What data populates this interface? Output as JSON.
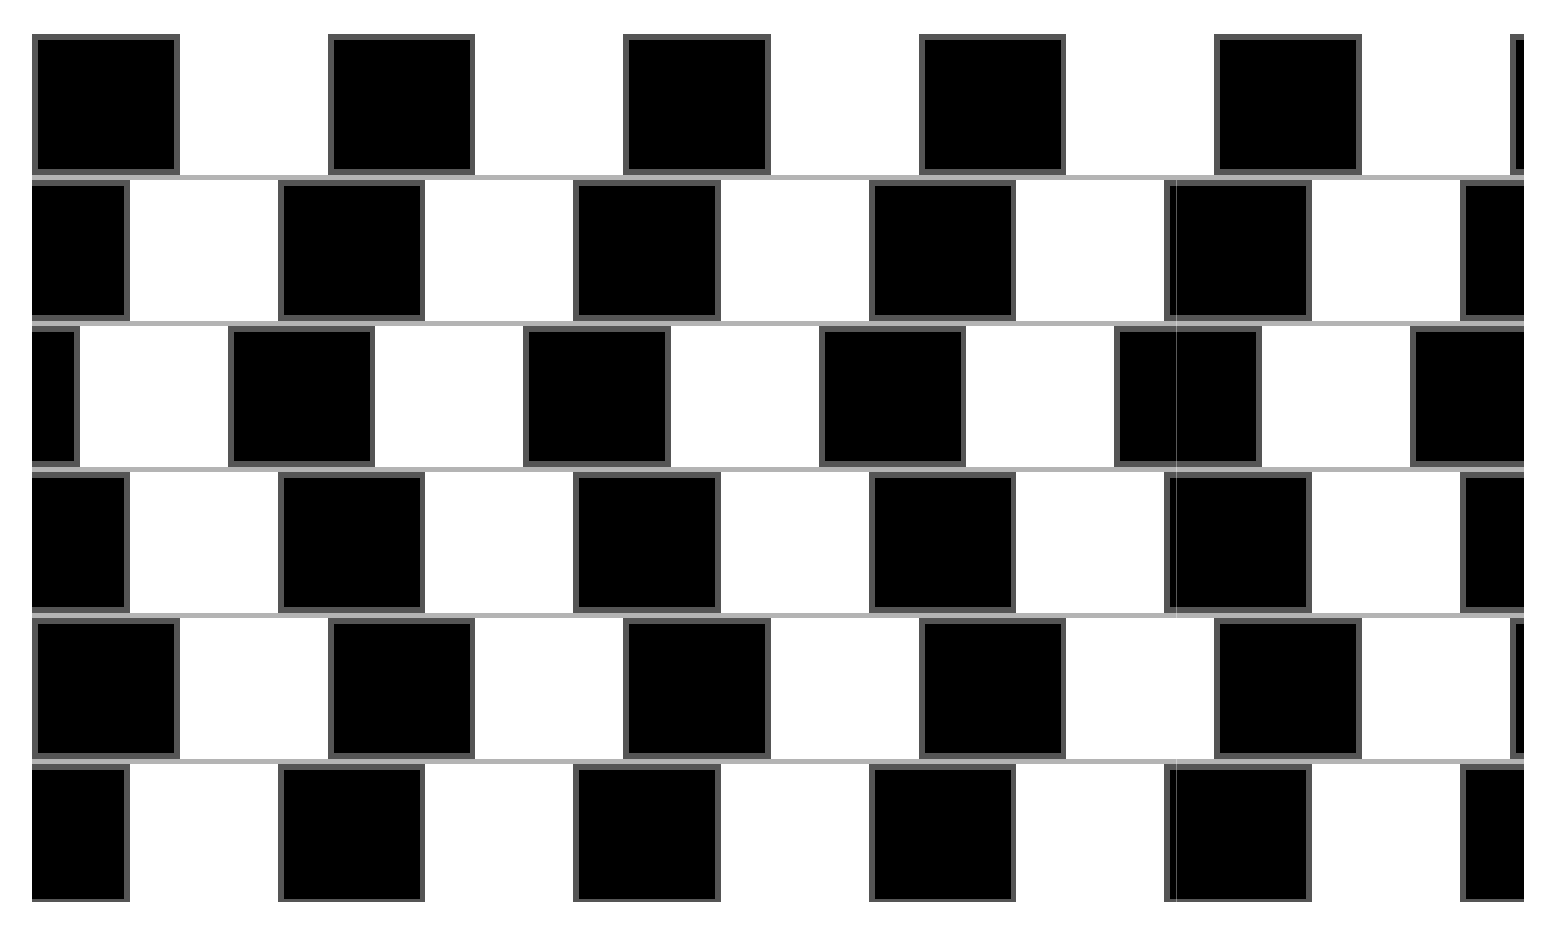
{
  "figure": {
    "colors": {
      "black_tile": "#000000",
      "white_tile": "#ffffff",
      "tile_border": "#555555",
      "mortar": "#b4b4b4",
      "background": "#ffffff"
    },
    "tile_width": 147.75,
    "row_height": 141,
    "mortar_height": 5,
    "rows": [
      {
        "index": 1,
        "top": 0,
        "offset": 0
      },
      {
        "index": 2,
        "top": 146,
        "offset": -50
      },
      {
        "index": 3,
        "top": 292,
        "offset": -100
      },
      {
        "index": 4,
        "top": 438,
        "offset": -50
      },
      {
        "index": 5,
        "top": 584,
        "offset": 0
      },
      {
        "index": 6,
        "top": 730,
        "offset": -50
      }
    ]
  }
}
